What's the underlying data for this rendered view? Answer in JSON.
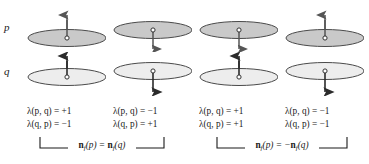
{
  "figure": {
    "row_labels": {
      "top": "p",
      "bottom": "q"
    },
    "colors": {
      "ellipse_fill_p": "#c9c9c9",
      "ellipse_fill_q": "#ededed",
      "ellipse_stroke": "#4a4a4a",
      "arrow": "#555555",
      "arrow_dark": "#2b2b2b",
      "text": "#1a1a1a",
      "bracket": "#1a1a1a",
      "background": "#ffffff"
    },
    "columns": [
      {
        "index": 1,
        "p": {
          "shape": "ellipse",
          "fill": "shaded",
          "normal_direction": "up",
          "vertex_marker": "open-circle"
        },
        "q": {
          "shape": "ellipse",
          "fill": "light",
          "normal_direction": "up",
          "vertex_marker": "open-circle"
        },
        "lambda_pq_label": "λ(p, q) = +1",
        "lambda_qp_label": "λ(q, p) = −1"
      },
      {
        "index": 2,
        "p": {
          "shape": "ellipse",
          "fill": "shaded",
          "normal_direction": "down",
          "vertex_marker": "open-circle"
        },
        "q": {
          "shape": "ellipse",
          "fill": "light",
          "normal_direction": "down",
          "vertex_marker": "open-circle"
        },
        "lambda_pq_label": "λ(p, q) = −1",
        "lambda_qp_label": "λ(q, p) = +1"
      },
      {
        "index": 3,
        "p": {
          "shape": "ellipse",
          "fill": "shaded",
          "normal_direction": "down",
          "vertex_marker": "open-circle"
        },
        "q": {
          "shape": "ellipse",
          "fill": "light",
          "normal_direction": "up",
          "vertex_marker": "open-circle"
        },
        "lambda_pq_label": "λ(p, q) = +1",
        "lambda_qp_label": "λ(q, p) = +1"
      },
      {
        "index": 4,
        "p": {
          "shape": "ellipse",
          "fill": "shaded",
          "normal_direction": "up",
          "vertex_marker": "open-circle"
        },
        "q": {
          "shape": "ellipse",
          "fill": "light",
          "normal_direction": "down",
          "vertex_marker": "open-circle"
        },
        "lambda_pq_label": "λ(p, q) = −1",
        "lambda_qp_label": "λ(q, p) = −1"
      }
    ],
    "brackets": [
      {
        "index": 1,
        "spans_columns": [
          1,
          2
        ],
        "prefix": "n",
        "subscript": "f",
        "equation_text": "(p) = ",
        "suffix_prefix": "n",
        "suffix_subscript": "f",
        "suffix_text": "(q)",
        "full_text": "n_f(p) = n_f(q)"
      },
      {
        "index": 2,
        "spans_columns": [
          3,
          4
        ],
        "prefix": "n",
        "subscript": "f",
        "equation_text": "(p) = −",
        "suffix_prefix": "n",
        "suffix_subscript": "f",
        "suffix_text": "(q)",
        "full_text": "n_f(p) = −n_f(q)"
      }
    ]
  }
}
